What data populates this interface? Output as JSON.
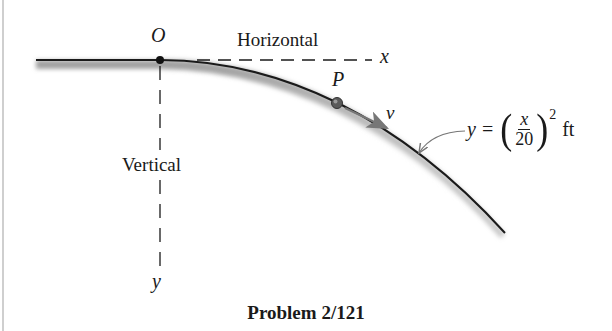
{
  "figure": {
    "caption": "Problem 2/121",
    "labels": {
      "origin": "O",
      "horizontal_axis_label": "Horizontal",
      "x_axis": "x",
      "point": "P",
      "velocity": "v",
      "vertical_axis_label": "Vertical",
      "y_axis": "y"
    },
    "equation": {
      "lhs": "y",
      "equals": "=",
      "numerator": "x",
      "denominator": "20",
      "exponent": "2",
      "unit": "ft",
      "text": "y = (x/20)^2 ft"
    },
    "colors": {
      "ink": "#1a1a1a",
      "arrow": "#777777",
      "shadow": "#9a9a9a",
      "ball": "#555555"
    }
  }
}
